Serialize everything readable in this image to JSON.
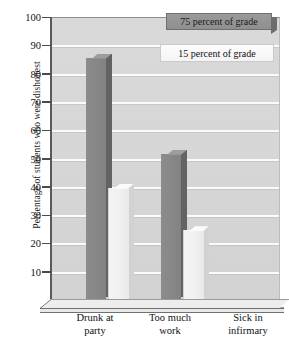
{
  "chart_data": {
    "type": "bar",
    "title": "",
    "xlabel": "",
    "ylabel": "Percentage of students who were dishonest",
    "categories": [
      "Drunk at party",
      "Too much work",
      "Sick in infirmary"
    ],
    "series": [
      {
        "name": "75 percent of grade",
        "values": [
          86,
          52,
          0
        ],
        "color": "#878787"
      },
      {
        "name": "15 percent of grade",
        "values": [
          40,
          25,
          0
        ],
        "color": "#f0f0f0"
      }
    ],
    "ylim": [
      0,
      100
    ],
    "yticks": [
      10,
      20,
      30,
      40,
      50,
      60,
      70,
      80,
      90,
      100
    ],
    "ytick_labels": [
      "10",
      "20",
      "30",
      "40",
      "50",
      "60",
      "70",
      "80",
      "90",
      "100"
    ],
    "grid": true,
    "legend_position": "top-right",
    "plot_background": "#d6d6d6",
    "style": "3d-bars"
  },
  "axis": {
    "y_title": "Percentage of students who were dishonest",
    "ticks": [
      {
        "value": 100,
        "label": "100"
      },
      {
        "value": 90,
        "label": "90"
      },
      {
        "value": 80,
        "label": "80"
      },
      {
        "value": 70,
        "label": "70"
      },
      {
        "value": 60,
        "label": "60"
      },
      {
        "value": 50,
        "label": "50"
      },
      {
        "value": 40,
        "label": "40"
      },
      {
        "value": 30,
        "label": "30"
      },
      {
        "value": 20,
        "label": "20"
      },
      {
        "value": 10,
        "label": "10"
      }
    ]
  },
  "categories": [
    {
      "line1": "Drunk at",
      "line2": "party"
    },
    {
      "line1": "Too much",
      "line2": "work"
    },
    {
      "line1": "Sick in",
      "line2": "infirmary"
    }
  ],
  "legend": {
    "dark_label": "75 percent of grade",
    "light_label": "15 percent of grade"
  }
}
